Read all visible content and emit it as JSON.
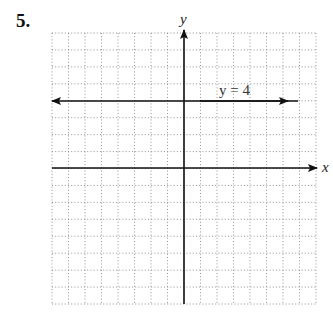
{
  "problem": {
    "number": "5."
  },
  "graph": {
    "x_axis_label": "x",
    "y_axis_label": "y",
    "x_range": [
      -8,
      8
    ],
    "y_range": [
      -8,
      8
    ],
    "grid_step": 1,
    "grid_style": "dotted"
  },
  "lines": [
    {
      "equation": "y = 4",
      "type": "horizontal",
      "y": 4,
      "label": "y = 4"
    }
  ],
  "chart_data": {
    "type": "line",
    "title": "",
    "xlabel": "x",
    "ylabel": "y",
    "xlim": [
      -8,
      8
    ],
    "ylim": [
      -8,
      8
    ],
    "grid": true,
    "series": [
      {
        "name": "y = 4",
        "x": [
          -8,
          8
        ],
        "y": [
          4,
          4
        ]
      }
    ],
    "annotations": [
      "y = 4"
    ]
  }
}
